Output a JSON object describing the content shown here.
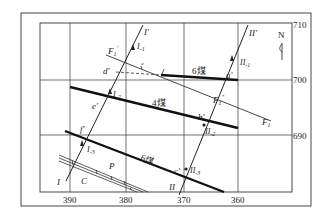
{
  "diagram": {
    "type": "geological structure contour map",
    "north_label": "N",
    "x_axis_ticks": [
      "390",
      "380",
      "370",
      "360"
    ],
    "y_axis_ticks": [
      "710",
      "700",
      "690"
    ],
    "seams": {
      "seam6_upper": "6煤",
      "seam4": "4煤",
      "seam6_lower": "6煤"
    },
    "fault": {
      "name": "F",
      "subscript": "1",
      "prime_label": "F",
      "prime_sub": "1",
      "prime_mark": "'",
      "double_prime_label": "F",
      "double_prime_sub": "1",
      "double_prime_mark": "″"
    },
    "section_lines": {
      "line1_start": "I",
      "line1_end": "I",
      "line1_end_mark": "'",
      "line1_points": [
        "I",
        "I",
        "I"
      ],
      "line1_point_subs": [
        "-1",
        "-2",
        "-3"
      ],
      "line2_start": "II",
      "line2_end": "II",
      "line2_end_mark": "'",
      "line2_points": [
        "II",
        "II",
        "II"
      ],
      "line2_point_subs": [
        "-1",
        "-2",
        "-3"
      ]
    },
    "intersection_points": [
      "a'",
      "b'",
      "c'",
      "d'",
      "e'",
      "f'"
    ],
    "strata_labels": {
      "c": "C",
      "p": "P"
    },
    "dash_mark": "a"
  }
}
